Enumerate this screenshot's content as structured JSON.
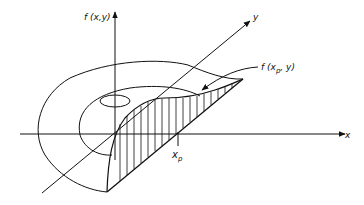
{
  "diagram": {
    "labels": {
      "z_axis": "f (x,y)",
      "y_axis": "y",
      "x_axis": "x",
      "slice_curve_prefix": "f (x",
      "slice_curve_sub": "p",
      "slice_curve_suffix": ", y)",
      "xp_main": "x",
      "xp_sub": "p"
    },
    "colors": {
      "stroke": "#111111",
      "background": "#ffffff"
    }
  }
}
